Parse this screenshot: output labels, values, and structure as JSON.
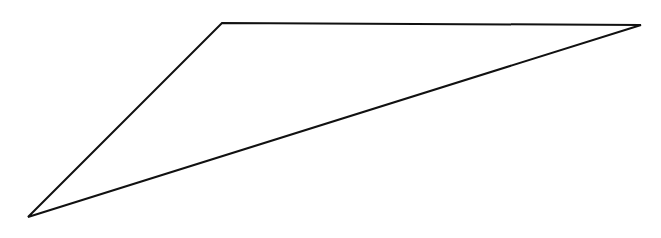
{
  "diagram": {
    "shape": "triangle",
    "stroke_color": "#111111",
    "stroke_width": 2,
    "fill": "none",
    "background": "#ffffff",
    "vertices": {
      "bottom_left": [
        28,
        217
      ],
      "top_left": [
        222,
        23
      ],
      "right": [
        641,
        25
      ]
    }
  }
}
